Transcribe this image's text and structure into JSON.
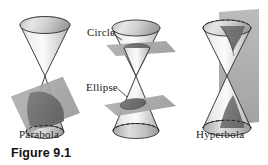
{
  "figure": {
    "caption": "Figure 9.1",
    "labels": {
      "parabola": "Parabola",
      "circle": "Circle",
      "ellipse": "Ellipse",
      "hyperbola": "Hyperbola"
    }
  },
  "colors": {
    "background": "#ffffff",
    "outline": "#1a1a1a",
    "plane_fill": "#a8a8a8",
    "plane_fill_light": "#b8b8b8",
    "section_fill": "#6e6e6e",
    "cone_light": "#f2f2f2",
    "cone_mid": "#d6d6d6",
    "cone_shadow": "#9a9a9a",
    "text": "#1a1a1a",
    "caption_text": "#111111"
  },
  "diagrams": [
    {
      "name": "parabola-diagram",
      "label": "Parabola",
      "plane_orientation": "slanted",
      "nappes_cut": 1,
      "conic": "parabola"
    },
    {
      "name": "circle-ellipse-diagram",
      "labels": [
        "Circle",
        "Ellipse"
      ],
      "planes": [
        {
          "label": "Circle",
          "orientation": "horizontal",
          "conic": "circle"
        },
        {
          "label": "Ellipse",
          "orientation": "tilted",
          "conic": "ellipse"
        }
      ],
      "nappes_cut": 2,
      "conic": "circle-and-ellipse"
    },
    {
      "name": "hyperbola-diagram",
      "label": "Hyperbola",
      "plane_orientation": "vertical",
      "nappes_cut": 2,
      "conic": "hyperbola"
    }
  ]
}
